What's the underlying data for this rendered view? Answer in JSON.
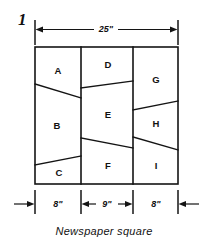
{
  "figure": {
    "number": "1",
    "caption": "Newspaper square",
    "top_dimension": {
      "label": "25\"",
      "value": 25,
      "unit": "inch"
    },
    "bottom_dimensions": [
      {
        "label": "8\"",
        "value": 8,
        "unit": "inch"
      },
      {
        "label": "9\"",
        "value": 9,
        "unit": "inch"
      },
      {
        "label": "8\"",
        "value": 8,
        "unit": "inch"
      }
    ],
    "pieces": [
      {
        "id": "A",
        "label": "A",
        "column": "left"
      },
      {
        "id": "B",
        "label": "B",
        "column": "left"
      },
      {
        "id": "C",
        "label": "C",
        "column": "left"
      },
      {
        "id": "D",
        "label": "D",
        "column": "middle"
      },
      {
        "id": "E",
        "label": "E",
        "column": "middle"
      },
      {
        "id": "F",
        "label": "F",
        "column": "middle"
      },
      {
        "id": "G",
        "label": "G",
        "column": "right"
      },
      {
        "id": "H",
        "label": "H",
        "column": "right"
      },
      {
        "id": "I",
        "label": "I",
        "column": "right"
      }
    ],
    "colors": {
      "ink": "#141414",
      "paper": "#ffffff"
    }
  }
}
